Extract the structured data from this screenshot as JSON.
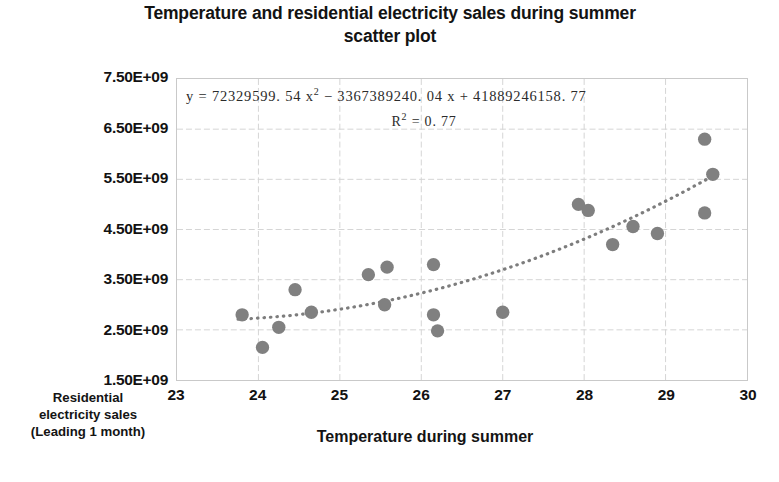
{
  "title": "Temperature and residential electricity sales during summer scatter plot",
  "title_line1": "Temperature and residential electricity sales during summer",
  "title_line2": "scatter plot",
  "equation": {
    "text": "y = 72329599.54 x² − 3367389240.04 x + 41889246158.77",
    "prefix": "y = 72329599. 54 x",
    "sup1": "2",
    "mid": " − 3367389240. 04 x + 41889246158. 77",
    "r2_prefix": "R",
    "r2_sup": "²",
    "r2_value": " = 0. 77",
    "r2_text": "R² = 0.77"
  },
  "axis": {
    "x_title": "Temperature during summer",
    "y_title_line1": "Residential",
    "y_title_line2": "electricity sales",
    "y_title_line3": "(Leading 1 month)",
    "y_title": "Residential electricity sales (Leading 1 month)"
  },
  "colors": {
    "marker": "#808080",
    "trendline": "#7d7d7d",
    "grid": "#d5d5d5",
    "frame": "#c9c9c9",
    "text": "#131313"
  },
  "chart_data": {
    "type": "scatter",
    "title": "Temperature and residential electricity sales during summer scatter plot",
    "xlabel": "Temperature during summer",
    "ylabel": "Residential electricity sales (Leading 1 month)",
    "xlim": [
      23,
      30
    ],
    "ylim": [
      1500000000,
      7500000000
    ],
    "xticks": [
      23,
      24,
      25,
      26,
      27,
      28,
      29,
      30
    ],
    "xticklabels": [
      "23",
      "24",
      "25",
      "26",
      "27",
      "28",
      "29",
      "30"
    ],
    "yticks": [
      1500000000,
      2500000000,
      3500000000,
      4500000000,
      5500000000,
      6500000000,
      7500000000
    ],
    "yticklabels": [
      "1.50E+09",
      "2.50E+09",
      "3.50E+09",
      "4.50E+09",
      "5.50E+09",
      "6.50E+09",
      "7.50E+09"
    ],
    "grid": true,
    "legend": false,
    "marker_color": "#808080",
    "marker_size": 9,
    "points": [
      {
        "x": 23.8,
        "y": 2800000000
      },
      {
        "x": 24.05,
        "y": 2150000000
      },
      {
        "x": 24.25,
        "y": 2550000000
      },
      {
        "x": 24.45,
        "y": 3300000000
      },
      {
        "x": 24.65,
        "y": 2850000000
      },
      {
        "x": 25.35,
        "y": 3600000000
      },
      {
        "x": 25.58,
        "y": 3750000000
      },
      {
        "x": 25.55,
        "y": 3000000000
      },
      {
        "x": 26.15,
        "y": 3800000000
      },
      {
        "x": 26.15,
        "y": 2800000000
      },
      {
        "x": 26.2,
        "y": 2480000000
      },
      {
        "x": 27.0,
        "y": 2850000000
      },
      {
        "x": 27.93,
        "y": 5000000000
      },
      {
        "x": 28.05,
        "y": 4880000000
      },
      {
        "x": 28.35,
        "y": 4200000000
      },
      {
        "x": 28.6,
        "y": 4560000000
      },
      {
        "x": 28.9,
        "y": 4420000000
      },
      {
        "x": 29.48,
        "y": 6300000000
      },
      {
        "x": 29.48,
        "y": 4830000000
      },
      {
        "x": 29.58,
        "y": 5600000000
      }
    ],
    "trendline": {
      "type": "polynomial",
      "degree": 2,
      "style": "dotted",
      "coefficients": [
        72329599.54,
        -3367389240.04,
        41889246158.77
      ],
      "equation": "y = 72329599.54 x² − 3367389240.04 x + 41889246158.77",
      "r_squared": 0.77
    }
  }
}
